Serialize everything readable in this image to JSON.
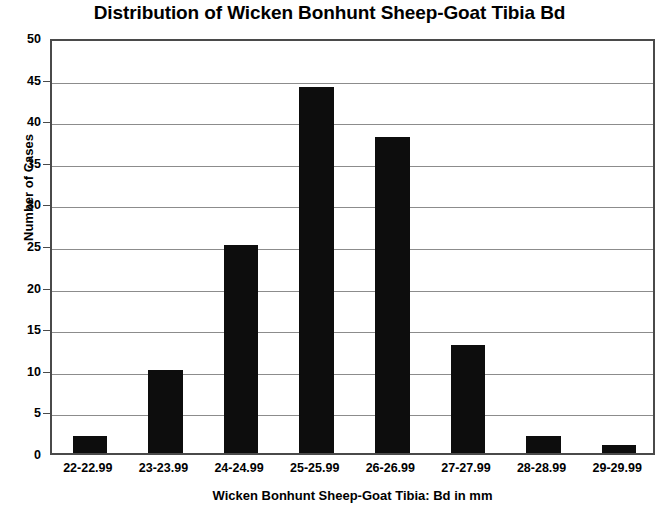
{
  "chart_data": {
    "type": "bar",
    "title": "Distribution of Wicken Bonhunt Sheep-Goat Tibia Bd",
    "xlabel": "Wicken Bonhunt Sheep-Goat Tibia: Bd in mm",
    "ylabel": "Number of Cases",
    "categories": [
      "22-22.99",
      "23-23.99",
      "24-24.99",
      "25-25.99",
      "26-26.99",
      "27-27.99",
      "28-28.99",
      "29-29.99"
    ],
    "values": [
      2,
      10,
      25,
      44,
      38,
      13,
      2,
      1
    ],
    "ylim": [
      0,
      50
    ],
    "yticks": [
      0,
      5,
      10,
      15,
      20,
      25,
      30,
      35,
      40,
      45,
      50
    ],
    "ytick_labels": [
      "0",
      "5",
      "10",
      "15",
      "20",
      "25",
      "30",
      "35",
      "40",
      "45",
      "50"
    ],
    "grid": true,
    "legend": false,
    "bar_color": "#0d0d0d",
    "grid_color": "#8c8c8c",
    "axis_color": "#4a4a4a",
    "background": "#ffffff"
  }
}
